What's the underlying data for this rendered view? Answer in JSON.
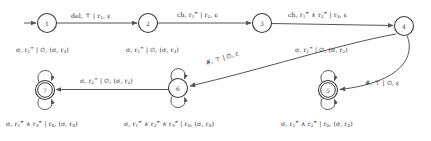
{
  "diagram": {
    "stroke_color": "#555555",
    "text_color": "#2e2e2e",
    "background": "#ffffff",
    "states": [
      {
        "id": "1",
        "label": "1",
        "cx": 47,
        "cy": 23,
        "r": 9.5,
        "accepting": false
      },
      {
        "id": "2",
        "label": "2",
        "cx": 148,
        "cy": 23,
        "r": 9.5,
        "accepting": false
      },
      {
        "id": "3",
        "label": "3",
        "cx": 262,
        "cy": 23,
        "r": 9.5,
        "accepting": false
      },
      {
        "id": "4",
        "label": "4",
        "cx": 404,
        "cy": 26,
        "r": 9.5,
        "accepting": false
      },
      {
        "id": "5",
        "label": "5",
        "cx": 328,
        "cy": 90,
        "r": 9.5,
        "accepting": true
      },
      {
        "id": "6",
        "label": "6",
        "cx": 178,
        "cy": 88,
        "r": 9.5,
        "accepting": false
      },
      {
        "id": "7",
        "label": "7",
        "cx": 45,
        "cy": 90,
        "r": 9.5,
        "accepting": true
      }
    ],
    "start_marker": {
      "from_state": "1",
      "label": "start-arrow"
    },
    "transitions": [
      {
        "id": "t1-2",
        "from": "1",
        "to": "2",
        "kind": "straight",
        "label_html": "del, &#8868; | r<sub>1</sub>, &#949;",
        "label_x": 71,
        "label_y": 13
      },
      {
        "id": "t2-3",
        "from": "2",
        "to": "3",
        "kind": "straight",
        "label_html": "ch, r<sub>1</sub><sup>&#8800;</sup> | r<sub>2</sub>, &#949;",
        "label_x": 177,
        "label_y": 12
      },
      {
        "id": "t3-4",
        "from": "3",
        "to": "4",
        "kind": "straight",
        "label_html": "ch, r<sub>1</sub><sup>&#8800;</sup> &#8743; r<sub>2</sub><sup>&#8800;</sup> | r<sub>3</sub>, &#949;",
        "label_x": 288,
        "label_y": 12
      },
      {
        "id": "t4-6",
        "from": "4",
        "to": "6",
        "kind": "curve-long",
        "label_html": "#, &#8868; | &#8709;, &#949;",
        "label_x": 206,
        "label_y": 60,
        "rotate": -17
      },
      {
        "id": "t4-5",
        "from": "4",
        "to": "5",
        "kind": "curve-right",
        "label_html": "#, &#8868; | &#8709;, &#949;",
        "label_x": 365,
        "label_y": 80
      },
      {
        "id": "t6-7",
        "from": "6",
        "to": "7",
        "kind": "straight",
        "label_html": "&#963;, r<sub>2</sub><sup>=</sup> | &#8709;, (&#963;, r<sub>2</sub>)",
        "label_x": 80,
        "label_y": 78
      }
    ],
    "self_loops": [
      {
        "id": "loop-7-top",
        "state": "7",
        "position": "top",
        "label_html": "&#963;, r<sub>1</sub><sup>=</sup> | &#8709;, (&#963;, r<sub>3</sub>)",
        "label_x": 16,
        "label_y": 47
      },
      {
        "id": "loop-7-bottom",
        "state": "7",
        "position": "bottom",
        "label_html": "&#963;, r<sub>1</sub><sup>&#8800;</sup> &#8743; r<sub>3</sub><sup>&#8800;</sup> | r<sub>0</sub>, (&#963;, r<sub>0</sub>)",
        "label_x": 6,
        "label_y": 121
      },
      {
        "id": "loop-6-top",
        "state": "6",
        "position": "top",
        "label_html": "&#963;, r<sub>1</sub><sup>=</sup> | &#8709;, (&#963;, r<sub>3</sub>)",
        "label_x": 126,
        "label_y": 47
      },
      {
        "id": "loop-6-bottom",
        "state": "6",
        "position": "bottom",
        "label_html": "&#963;, r<sub>1</sub><sup>&#8800;</sup> &#8743; r<sub>2</sub><sup>&#8800;</sup> &#8743; r<sub>3</sub><sup>&#8800;</sup> | r<sub>0</sub>, (&#963;, r<sub>0</sub>)",
        "label_x": 124,
        "label_y": 121
      },
      {
        "id": "loop-5-top",
        "state": "5",
        "position": "top",
        "label_html": "&#963;, r<sub>1</sub><sup>=</sup> | &#8709;, (&#963;, r<sub>2</sub>)",
        "label_x": 295,
        "label_y": 47
      },
      {
        "id": "loop-5-bottom",
        "state": "5",
        "position": "bottom",
        "label_html": "&#963;, r<sub>1</sub><sup>&#8800;</sup> &#8743; r<sub>2</sub><sup>&#8800;</sup> | r<sub>0</sub>, (&#963;, r<sub>0</sub>)",
        "label_x": 281,
        "label_y": 121
      }
    ]
  }
}
